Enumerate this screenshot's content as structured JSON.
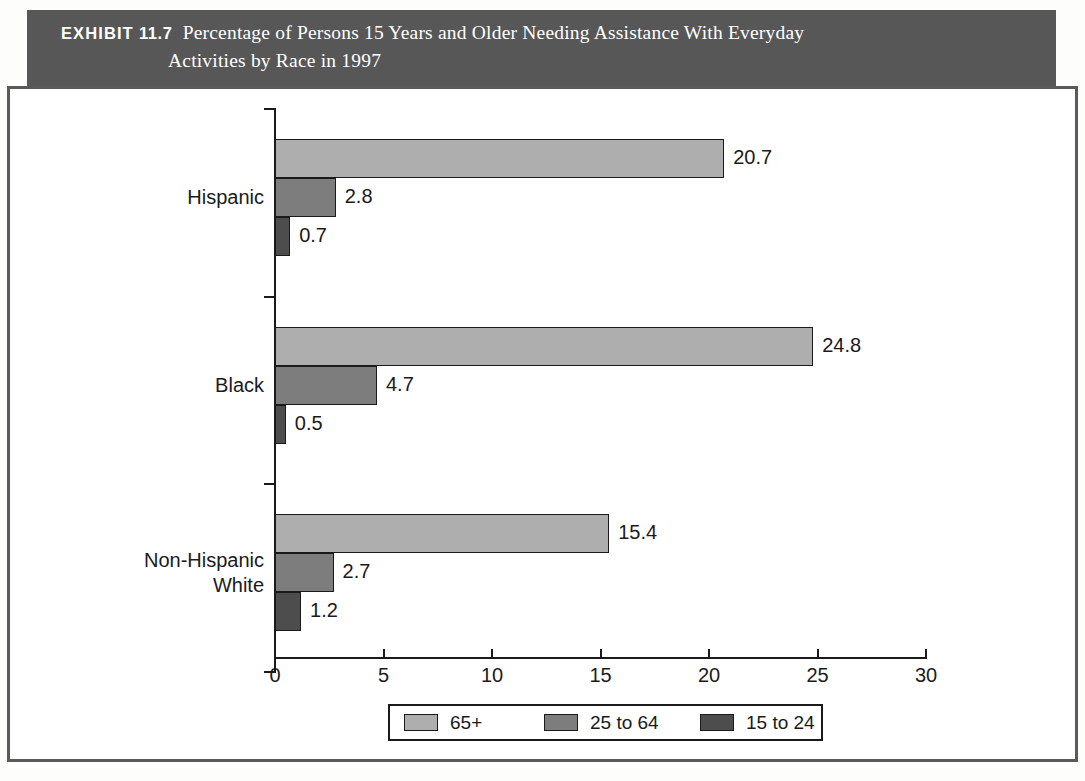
{
  "exhibit": {
    "label": "EXHIBIT",
    "number": "11.7",
    "title_line1": "Percentage of Persons 15 Years and Older Needing Assistance With Everyday",
    "title_line2": "Activities by Race in 1997",
    "header_bg": "#575757",
    "header_text_color": "#ffffff"
  },
  "chart_data": {
    "type": "bar",
    "orientation": "horizontal",
    "title": "Percentage of Persons 15 Years and Older Needing Assistance With Everyday Activities by Race in 1997",
    "xlabel": "",
    "ylabel": "",
    "xlim": [
      0,
      30
    ],
    "xticks": [
      0,
      5,
      10,
      15,
      20,
      25,
      30
    ],
    "xticklabels": [
      "0",
      "5",
      "10",
      "15",
      "20",
      "25",
      "30"
    ],
    "grid": false,
    "legend_position": "bottom",
    "categories": [
      "Hispanic",
      "Black",
      "Non-Hispanic White"
    ],
    "category_labels": [
      [
        "Hispanic"
      ],
      [
        "Black"
      ],
      [
        "Non-Hispanic",
        "White"
      ]
    ],
    "series": [
      {
        "name": "65+",
        "color": "#aeaeae",
        "values": [
          20.7,
          24.8,
          15.4
        ],
        "value_labels": [
          "20.7",
          "24.8",
          "15.4"
        ]
      },
      {
        "name": "25 to 64",
        "color": "#7d7d7d",
        "values": [
          2.8,
          4.7,
          2.7
        ],
        "value_labels": [
          "2.8",
          "4.7",
          "2.7"
        ]
      },
      {
        "name": "15 to 24",
        "color": "#4d4d4d",
        "values": [
          0.7,
          0.5,
          1.2
        ],
        "value_labels": [
          "0.7",
          "0.5",
          "1.2"
        ]
      }
    ],
    "legend": [
      {
        "label": "65+",
        "color": "#aeaeae"
      },
      {
        "label": "25 to 64",
        "color": "#7d7d7d"
      },
      {
        "label": "15 to 24",
        "color": "#4d4d4d"
      }
    ]
  }
}
